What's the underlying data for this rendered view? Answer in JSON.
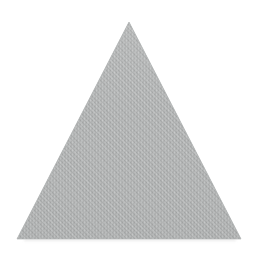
{
  "canvas": {
    "width": 272,
    "height": 258,
    "background_color": "#ffffff",
    "description": "Single grey textured triangle centered on a plain white background"
  },
  "figure": {
    "name": "triangle",
    "shape_type": "triangle",
    "orientation": "point-up",
    "classification": "isosceles",
    "fill_color": "#adafaf",
    "fill_color_light": "#bcbebe",
    "fill_color_dark": "#9ea1a1",
    "fill_style": "dithered-halftone-crosshatch",
    "stroke_color": "none",
    "has_outline": false,
    "vertices": [
      {
        "label": "apex",
        "x": 129,
        "y": 22
      },
      {
        "label": "bottom-left",
        "x": 17,
        "y": 239
      },
      {
        "label": "bottom-right",
        "x": 241,
        "y": 239
      }
    ],
    "points_attr": "129,22 17,239 241,239",
    "base_width": 224,
    "height": 217,
    "centroid": {
      "x": 129,
      "y": 167
    },
    "shadow": {
      "present": true,
      "color": "#d6d6d6",
      "position": "below-base",
      "y": 240,
      "opacity": 0.5
    }
  },
  "texture": {
    "pattern_name": "dither-crosshatch",
    "cell_size": 4,
    "dot_color": "#a0a3a3",
    "line_color": "#b8baba",
    "base_color": "#b0b2b2"
  }
}
